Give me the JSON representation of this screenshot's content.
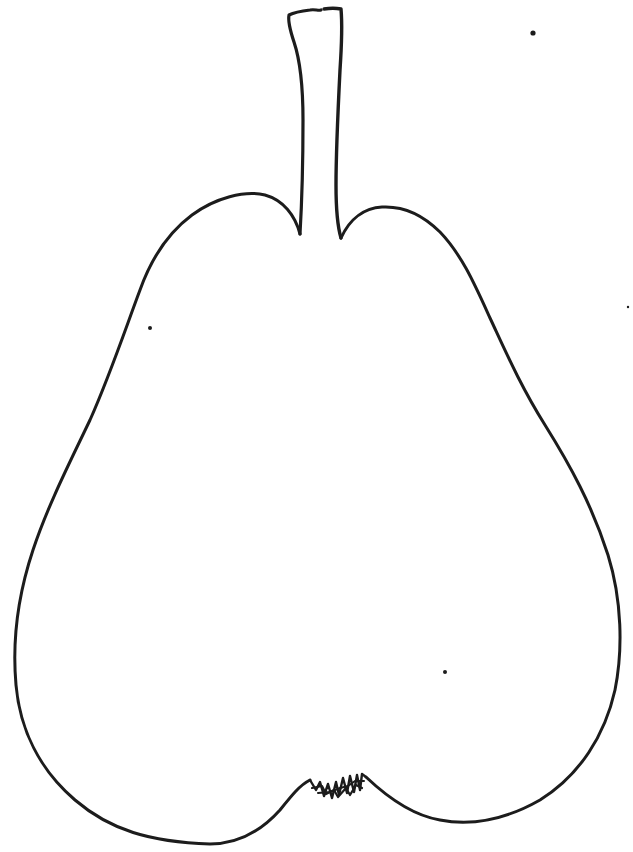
{
  "image": {
    "subject": "pear line drawing",
    "description": "Hand-drawn black outline of a pear with a tall stem and a scribbled blossom end on a white background",
    "background_color": "#ffffff",
    "ink_color": "#1c1c1c"
  },
  "parts": {
    "stem": "stem",
    "body": "pear-body",
    "blossom_end": "blossom-end"
  },
  "specks": [
    {
      "x": 533,
      "y": 33,
      "r": 2.6
    },
    {
      "x": 150,
      "y": 328,
      "r": 2.0
    },
    {
      "x": 628,
      "y": 307,
      "r": 1.2
    },
    {
      "x": 445,
      "y": 672,
      "r": 2.0
    }
  ]
}
